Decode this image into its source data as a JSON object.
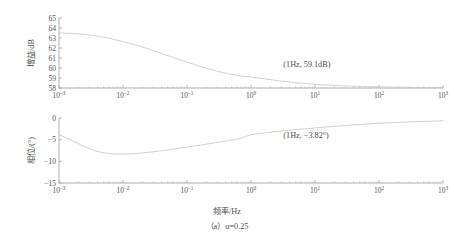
{
  "figure": {
    "caption": "（a）α=0.25",
    "xlabel": "频率/Hz"
  },
  "chart_data": [
    {
      "type": "line",
      "id": "gain-plot",
      "title": "",
      "xlabel": "频率/Hz",
      "ylabel": "增益/dB",
      "xscale": "log",
      "xlim": [
        0.001,
        1000
      ],
      "ylim": [
        58,
        65
      ],
      "yticks": [
        58,
        59,
        60,
        61,
        62,
        63,
        64,
        65
      ],
      "ytick_labels": [
        "58",
        "59",
        "60",
        "61",
        "62",
        "63",
        "64",
        "65"
      ],
      "xticks": [
        0.001,
        0.01,
        0.1,
        1,
        10,
        100,
        1000
      ],
      "xtick_labels": [
        "10⁻³",
        "10⁻²",
        "10⁻¹",
        "10⁰",
        "10¹",
        "10²",
        "10³"
      ],
      "xtick_mantissas": [
        "10",
        "10",
        "10",
        "10",
        "10",
        "10",
        "10"
      ],
      "xtick_exponents": [
        "-3",
        "-2",
        "-1",
        "0",
        "1",
        "2",
        "3"
      ],
      "grid": false,
      "legend": "none",
      "annotations": [
        {
          "text": "(1Hz, 59.1dB)",
          "x": 1,
          "y": 59.1,
          "label_x": 3.2,
          "label_y": 60.1
        }
      ],
      "series": [
        {
          "name": "gain",
          "x": [
            0.001,
            0.0013,
            0.0017,
            0.0022,
            0.0028,
            0.0036,
            0.0046,
            0.006,
            0.0077,
            0.01,
            0.013,
            0.017,
            0.022,
            0.028,
            0.036,
            0.046,
            0.06,
            0.077,
            0.1,
            0.13,
            0.17,
            0.22,
            0.28,
            0.36,
            0.46,
            0.6,
            0.77,
            1,
            1.3,
            1.7,
            2.2,
            2.8,
            3.6,
            4.6,
            6,
            7.7,
            10,
            13,
            17,
            22,
            28,
            36,
            46,
            60,
            77,
            100,
            130,
            170,
            220,
            280,
            360,
            460,
            600,
            770,
            1000
          ],
          "y": [
            63.5,
            63.48,
            63.45,
            63.4,
            63.33,
            63.24,
            63.12,
            62.98,
            62.82,
            62.64,
            62.45,
            62.24,
            62.02,
            61.79,
            61.55,
            61.31,
            61.06,
            60.82,
            60.58,
            60.34,
            60.12,
            59.91,
            59.72,
            59.55,
            59.4,
            59.27,
            59.17,
            59.1,
            59.0,
            58.9,
            58.8,
            58.71,
            58.63,
            58.55,
            58.48,
            58.42,
            58.37,
            58.32,
            58.28,
            58.25,
            58.22,
            58.19,
            58.17,
            58.15,
            58.13,
            58.12,
            58.1,
            58.09,
            58.08,
            58.07,
            58.06,
            58.055,
            58.05,
            58.045,
            58.04
          ]
        }
      ]
    },
    {
      "type": "line",
      "id": "phase-plot",
      "title": "",
      "xlabel": "频率/Hz",
      "ylabel": "相位/(°)",
      "xscale": "log",
      "xlim": [
        0.001,
        1000
      ],
      "ylim": [
        -15,
        0
      ],
      "yticks": [
        -15,
        -10,
        -5,
        0
      ],
      "ytick_labels": [
        "−15",
        "−10",
        "−5",
        "0"
      ],
      "xticks": [
        0.001,
        0.01,
        0.1,
        1,
        10,
        100,
        1000
      ],
      "xtick_labels": [
        "10⁻³",
        "10⁻²",
        "10⁻¹",
        "10⁰",
        "10¹",
        "10²",
        "10³"
      ],
      "xtick_mantissas": [
        "10",
        "10",
        "10",
        "10",
        "10",
        "10",
        "10"
      ],
      "xtick_exponents": [
        "-3",
        "-2",
        "-1",
        "0",
        "1",
        "2",
        "3"
      ],
      "grid": false,
      "legend": "none",
      "annotations": [
        {
          "text": "(1Hz, −3.82°)",
          "x": 1,
          "y": -3.82,
          "label_x": 3.2,
          "label_y": -4.6
        }
      ],
      "series": [
        {
          "name": "phase",
          "x": [
            0.001,
            0.0013,
            0.0017,
            0.0022,
            0.0028,
            0.0036,
            0.0046,
            0.006,
            0.0077,
            0.01,
            0.013,
            0.017,
            0.022,
            0.028,
            0.036,
            0.046,
            0.06,
            0.077,
            0.1,
            0.13,
            0.17,
            0.22,
            0.28,
            0.36,
            0.46,
            0.6,
            0.77,
            1,
            1.3,
            1.7,
            2.2,
            2.8,
            3.6,
            4.6,
            6,
            7.7,
            10,
            13,
            17,
            22,
            28,
            36,
            46,
            60,
            77,
            100,
            130,
            170,
            220,
            280,
            360,
            460,
            600,
            770,
            1000
          ],
          "y": [
            -3.85,
            -4.6,
            -5.4,
            -6.2,
            -6.9,
            -7.5,
            -7.95,
            -8.2,
            -8.3,
            -8.3,
            -8.25,
            -8.15,
            -8.0,
            -7.85,
            -7.65,
            -7.45,
            -7.2,
            -6.95,
            -6.7,
            -6.45,
            -6.2,
            -5.95,
            -5.7,
            -5.45,
            -5.2,
            -4.9,
            -4.45,
            -3.82,
            -3.6,
            -3.4,
            -3.2,
            -3.05,
            -2.9,
            -2.75,
            -2.6,
            -2.45,
            -2.3,
            -2.15,
            -2.0,
            -1.88,
            -1.76,
            -1.64,
            -1.53,
            -1.42,
            -1.32,
            -1.23,
            -1.14,
            -1.06,
            -0.99,
            -0.92,
            -0.86,
            -0.8,
            -0.74,
            -0.69,
            -0.64
          ]
        }
      ]
    }
  ]
}
